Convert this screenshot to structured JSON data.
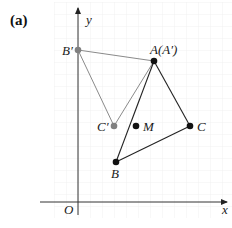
{
  "figure": {
    "panel_label": "(a)",
    "axes": {
      "x_label": "x",
      "y_label": "y",
      "origin_label": "O"
    },
    "points": {
      "B_prime": {
        "label": "B′",
        "color": "#808080"
      },
      "A": {
        "label": "A(A′)",
        "color": "#111111"
      },
      "C_prime": {
        "label": "C′",
        "color": "#808080"
      },
      "M": {
        "label": "M",
        "color": "#111111"
      },
      "C": {
        "label": "C",
        "color": "#111111"
      },
      "B": {
        "label": "B",
        "color": "#111111"
      }
    },
    "colors": {
      "original_triangle": "#222222",
      "image_triangle": "#8a8a8a",
      "grid": "#efefef",
      "axis": "#333333"
    }
  }
}
